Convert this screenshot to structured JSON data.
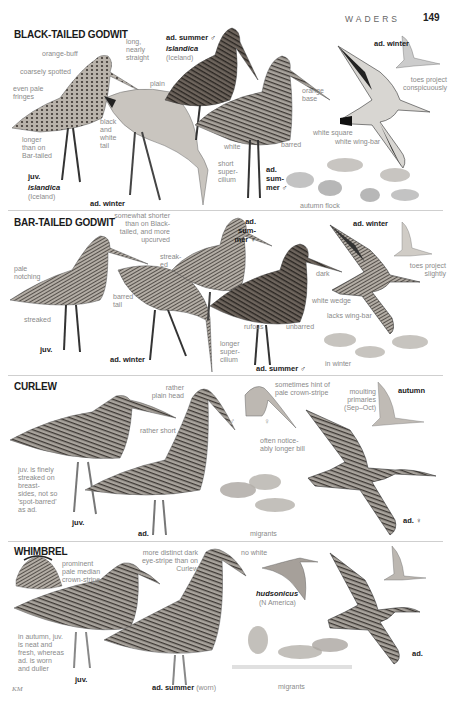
{
  "header": {
    "section": "WADERS",
    "page_number": "149"
  },
  "credit": "KM",
  "colors": {
    "text_dark": "#1a1a1a",
    "annotation": "#8a8a8a",
    "divider": "#cfcfcf",
    "header_grey": "#666666"
  },
  "species": [
    {
      "name": "BLACK-TAILED GODWIT",
      "labels": {
        "orange_buff": "orange-buff",
        "coarsely_spotted": "coarsely spotted",
        "even_pale_fringes": "even pale fringes",
        "long_nearly_straight": "long, nearly straight",
        "plain": "plain",
        "black_white_tail": "black and white tail",
        "longer_than_bar": "longer than on Bar-tailed",
        "orange_base": "orange base",
        "white": "white",
        "barred": "barred",
        "short_supercilium": "short super-cilium",
        "toes_project": "toes project conspicuously",
        "white_square": "white square",
        "white_wing_bar": "white wing-bar",
        "autumn_flock": "autumn flock"
      },
      "ages": {
        "ad_summer": "ad. summer ♂",
        "islandica_1": "islandica",
        "iceland_1": "(Iceland)",
        "juv": "juv.",
        "islandica_2": "islandica",
        "iceland_2": "(Iceland)",
        "ad_winter_1": "ad. winter",
        "ad_winter_2": "ad. winter",
        "ad_summer_flock": "ad. sum-mer ♂"
      }
    },
    {
      "name": "BAR-TAILED GODWIT",
      "labels": {
        "somewhat_shorter": "somewhat shorter than on Black-tailed, and more upcurved",
        "streaked_1": "streak-ed",
        "pale_notching": "pale notching",
        "barred_tail": "barred tail",
        "streaked_2": "streaked",
        "dark": "dark",
        "rufous": "rufous",
        "unbarred": "unbarred",
        "longer_supercilium": "longer super-cilium",
        "toes_project_slightly": "toes project slightly",
        "white_wedge": "white wedge",
        "lacks_wing_bar": "lacks wing-bar",
        "in_winter": "in winter"
      },
      "ages": {
        "ad_summer_f": "ad. sum-mer ♀",
        "ad_winter_1": "ad. winter",
        "juv": "juv.",
        "ad_winter_2": "ad. winter",
        "ad_summer_m": "ad. summer ♂"
      }
    },
    {
      "name": "CURLEW",
      "labels": {
        "rather_plain_head": "rather plain head",
        "sometimes_hint": "sometimes hint of pale crown-stripe",
        "rather_short": "rather short",
        "male": "♂",
        "female": "♀",
        "often_longer_bill": "often notice-ably longer bill",
        "moulting_primaries": "moulting primaries (Sep–Oct)",
        "juv_note": "juv. is finely streaked on breast-sides, not so 'spot-barred' as ad.",
        "migrants": "migrants"
      },
      "ages": {
        "autumn": "autumn",
        "juv": "juv.",
        "ad": "ad.",
        "ad_female": "ad. ♀"
      }
    },
    {
      "name": "WHIMBREL",
      "labels": {
        "prominent_stripe": "prominent pale median crown-stripe",
        "more_distinct": "more distinct dark eye-stripe than on Curlew",
        "no_white": "no white",
        "juv_note": "in autumn, juv. is neat and fresh, whereas ad. is worn and duller",
        "migrants": "migrants"
      },
      "ages": {
        "hudsonicus": "hudsonicus",
        "n_america": "(N America)",
        "juv": "juv.",
        "ad_summer": "ad. summer",
        "worn": "(worn)",
        "ad": "ad."
      }
    }
  ]
}
